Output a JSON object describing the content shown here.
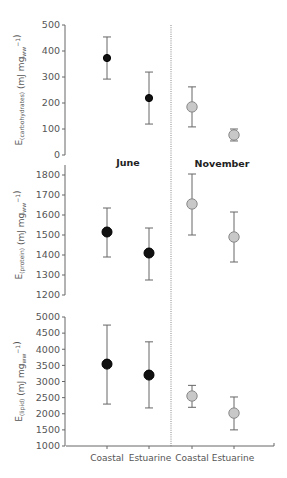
{
  "chart_data": {
    "type": "scatter",
    "categories": [
      "Coastal",
      "Estuarine",
      "Coastal",
      "Estuarine"
    ],
    "seasons": [
      "June",
      "November"
    ],
    "season_colors": {
      "June": "#111111",
      "November": "#c8c8c8"
    },
    "panels": [
      {
        "id": "carbohydrates",
        "ylabel_main": "E",
        "ylabel_sub": "(carbohydrates)",
        "ylabel_units": " (mJ mg",
        "ylabel_units_sub": "ww",
        "ylabel_units_sup": "−1",
        "ylabel_close": ")",
        "ylim": [
          0,
          500
        ],
        "yticks": [
          0,
          100,
          200,
          300,
          400,
          500
        ],
        "points": [
          {
            "season": "June",
            "site": "Coastal",
            "mean": 373,
            "upper": 454,
            "lower": 292
          },
          {
            "season": "June",
            "site": "Estuarine",
            "mean": 219,
            "upper": 319,
            "lower": 119
          },
          {
            "season": "November",
            "site": "Coastal",
            "mean": 185,
            "upper": 262,
            "lower": 108
          },
          {
            "season": "November",
            "site": "Estuarine",
            "mean": 77,
            "upper": 100,
            "lower": 54
          }
        ]
      },
      {
        "id": "protein",
        "ylabel_main": "E",
        "ylabel_sub": "(protein)",
        "ylabel_units": " (mJ mg",
        "ylabel_units_sub": "ww",
        "ylabel_units_sup": "−1",
        "ylabel_close": ")",
        "ylim": [
          1200,
          1800
        ],
        "yticks": [
          1200,
          1300,
          1400,
          1500,
          1600,
          1700,
          1800
        ],
        "points": [
          {
            "season": "June",
            "site": "Coastal",
            "mean": 1515,
            "upper": 1635,
            "lower": 1390
          },
          {
            "season": "June",
            "site": "Estuarine",
            "mean": 1410,
            "upper": 1535,
            "lower": 1275
          },
          {
            "season": "November",
            "site": "Coastal",
            "mean": 1655,
            "upper": 1805,
            "lower": 1500
          },
          {
            "season": "November",
            "site": "Estuarine",
            "mean": 1490,
            "upper": 1615,
            "lower": 1365
          }
        ]
      },
      {
        "id": "lipid",
        "ylabel_main": "E",
        "ylabel_sub": "(lipid)",
        "ylabel_units": " (mJ mg",
        "ylabel_units_sub": "ww",
        "ylabel_units_sup": "−1",
        "ylabel_close": ")",
        "ylim": [
          1000,
          5000
        ],
        "yticks": [
          1000,
          1500,
          2000,
          2500,
          3000,
          3500,
          4000,
          4500,
          5000
        ],
        "points": [
          {
            "season": "June",
            "site": "Coastal",
            "mean": 3540,
            "upper": 4750,
            "lower": 2300
          },
          {
            "season": "June",
            "site": "Estuarine",
            "mean": 3200,
            "upper": 4230,
            "lower": 2180
          },
          {
            "season": "November",
            "site": "Coastal",
            "mean": 2550,
            "upper": 2880,
            "lower": 2200
          },
          {
            "season": "November",
            "site": "Estuarine",
            "mean": 2020,
            "upper": 2520,
            "lower": 1500
          }
        ]
      }
    ],
    "annotations": [
      "June",
      "November"
    ],
    "xlabel": "",
    "grid": false,
    "legend": "none"
  },
  "labels": {
    "june": "June",
    "november": "November",
    "x_categories": [
      "Coastal",
      "Estuarine",
      "Coastal",
      "Estuarine"
    ]
  }
}
